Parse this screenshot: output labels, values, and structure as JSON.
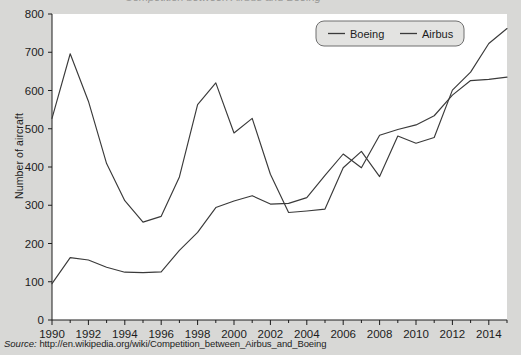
{
  "page": {
    "background_color": "#d8d8d6",
    "plot_background_color": "#ffffff",
    "cropped_header_text": "Competition between Airbus and Boeing"
  },
  "source": {
    "lead": "Source:",
    "url": "http://en.wikipedia.org/wiki/Competition_between_Airbus_and_Boeing"
  },
  "legend": {
    "position": "top-right",
    "box_fill": "#e3e3e1",
    "entries": [
      {
        "label": "Boeing",
        "color": "#3a3a3a"
      },
      {
        "label": "Airbus",
        "color": "#3a3a3a"
      }
    ]
  },
  "chart_data": {
    "type": "line",
    "title": "",
    "xlabel": "",
    "ylabel": "Number of aircraft",
    "xlim": [
      1990,
      2015
    ],
    "ylim": [
      0,
      800
    ],
    "ytick_step": 100,
    "yticks": [
      0,
      100,
      200,
      300,
      400,
      500,
      600,
      700,
      800
    ],
    "xticks_major": [
      1990,
      1992,
      1994,
      1996,
      1998,
      2000,
      2002,
      2004,
      2006,
      2008,
      2010,
      2012,
      2014
    ],
    "xticks_minor_every": 1,
    "grid": false,
    "x": [
      1990,
      1991,
      1992,
      1993,
      1994,
      1995,
      1996,
      1997,
      1998,
      1999,
      2000,
      2001,
      2002,
      2003,
      2004,
      2005,
      2006,
      2007,
      2008,
      2009,
      2010,
      2011,
      2012,
      2013,
      2014,
      2015
    ],
    "series": [
      {
        "name": "Boeing",
        "color": "#3a3a3a",
        "values": [
          527,
          696,
          572,
          409,
          312,
          256,
          271,
          374,
          563,
          620,
          489,
          527,
          381,
          281,
          285,
          290,
          398,
          441,
          375,
          481,
          462,
          477,
          601,
          648,
          723,
          762
        ]
      },
      {
        "name": "Airbus",
        "color": "#3a3a3a",
        "values": [
          95,
          163,
          157,
          138,
          125,
          124,
          126,
          182,
          229,
          294,
          311,
          325,
          303,
          305,
          320,
          378,
          434,
          398,
          483,
          498,
          510,
          534,
          588,
          626,
          629,
          635
        ]
      }
    ]
  }
}
